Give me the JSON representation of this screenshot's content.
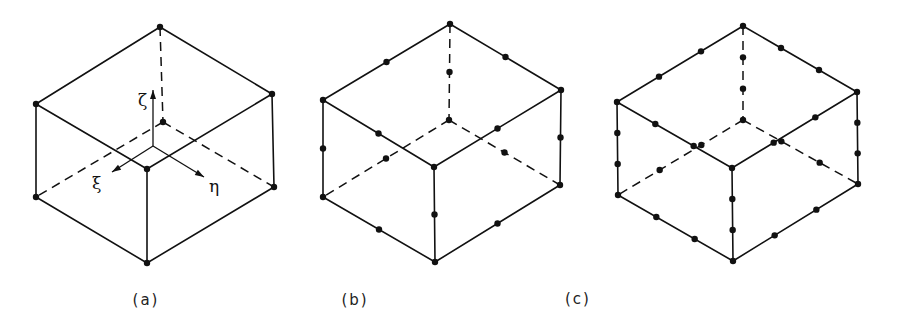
{
  "figure": {
    "panels": [
      {
        "id": "a",
        "caption": "(a)",
        "caption_pos": [
          146,
          305
        ],
        "vertices": {
          "top": [
            160,
            27
          ],
          "left": [
            36,
            104
          ],
          "right": [
            272,
            94
          ],
          "front": [
            147,
            169
          ],
          "back_bottom": [
            163,
            122
          ],
          "bottom_left": [
            36,
            197
          ],
          "bottom_right": [
            274,
            187
          ],
          "bottom_front": [
            147,
            263
          ]
        },
        "nodes_per_edge": 0,
        "axes": {
          "origin": [
            153,
            146
          ],
          "zeta": {
            "label": "ζ",
            "tip": [
              153,
              90
            ],
            "label_pos": [
              138,
              106
            ]
          },
          "xi": {
            "label": "ξ",
            "tip": [
              112,
              172
            ],
            "label_pos": [
              92,
              189
            ]
          },
          "eta": {
            "label": "η",
            "tip": [
              204,
              177
            ],
            "label_pos": [
              209,
              192
            ]
          }
        }
      },
      {
        "id": "b",
        "caption": "(b)",
        "caption_pos": [
          355,
          305
        ],
        "vertices": {
          "top": [
            450,
            24
          ],
          "left": [
            323,
            100
          ],
          "right": [
            561,
            90
          ],
          "front": [
            434,
            167
          ],
          "back_bottom": [
            449,
            120
          ],
          "bottom_left": [
            323,
            197
          ],
          "bottom_right": [
            560,
            185
          ],
          "bottom_front": [
            435,
            262
          ]
        },
        "nodes_per_edge": 1
      },
      {
        "id": "c",
        "caption": "(c)",
        "caption_pos": [
          578,
          304
        ],
        "vertices": {
          "top": [
            743,
            26
          ],
          "left": [
            617,
            102
          ],
          "right": [
            857,
            92
          ],
          "front": [
            732,
            168
          ],
          "back_bottom": [
            743,
            120
          ],
          "bottom_left": [
            618,
            195
          ],
          "bottom_right": [
            858,
            184
          ],
          "bottom_front": [
            733,
            261
          ]
        },
        "nodes_per_edge": 2
      }
    ]
  }
}
